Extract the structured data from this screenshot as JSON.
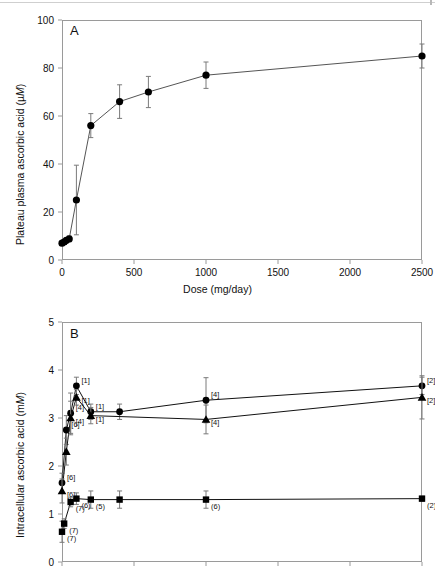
{
  "figure": {
    "panels": [
      "A",
      "B"
    ],
    "marker_color": "#000000",
    "line_color": "#555555",
    "axis_color": "#9a9a9a"
  },
  "panelA": {
    "letter": "A",
    "ytitle_plain": "Plateau plasma ascorbic acid (µM)",
    "ytitle_pre": "Plateau plasma ascorbic acid (µ",
    "ytitle_italic": "M",
    "ytitle_post": ")",
    "xtitle": "Dose (mg/day)",
    "yticks": [
      "0",
      "20",
      "40",
      "60",
      "80",
      "100"
    ],
    "xticks": [
      "0",
      "500",
      "1000",
      "1500",
      "2000",
      "2500"
    ]
  },
  "panelB": {
    "letter": "B",
    "ytitle_pre": "Intracellular ascorbic acid (m",
    "ytitle_italic": "M",
    "ytitle_post": ")",
    "yticks": [
      "0",
      "1",
      "2",
      "3",
      "4",
      "5"
    ],
    "xtitle": ""
  },
  "chart_data": [
    {
      "type": "line",
      "panel": "A",
      "title": "Plateau plasma ascorbic acid versus dose",
      "xlabel": "Dose (mg/day)",
      "ylabel": "Plateau plasma ascorbic acid (µM)",
      "xlim": [
        0,
        2500
      ],
      "ylim": [
        0,
        100
      ],
      "xticks": [
        0,
        500,
        1000,
        1500,
        2000,
        2500
      ],
      "yticks": [
        0,
        20,
        40,
        60,
        80,
        100
      ],
      "grid": false,
      "legend": "none",
      "marker": "filled-circle",
      "series": [
        {
          "name": "Plateau plasma ascorbic acid",
          "x": [
            0,
            15,
            30,
            50,
            100,
            200,
            400,
            1000,
            2500
          ],
          "values": [
            7.0,
            7.5,
            8.2,
            8.8,
            25.0,
            56.0,
            66.0,
            70.0,
            77.0
          ],
          "errors": [
            1.0,
            1.0,
            1.0,
            1.2,
            14.5,
            5.0,
            7.0,
            6.5,
            5.5
          ]
        }
      ],
      "points": [
        {
          "x": 0,
          "y": 7.0,
          "err": 1.0
        },
        {
          "x": 15,
          "y": 7.5,
          "err": 1.0
        },
        {
          "x": 30,
          "y": 8.2,
          "err": 1.0
        },
        {
          "x": 50,
          "y": 8.8,
          "err": 1.2
        },
        {
          "x": 100,
          "y": 25.0,
          "err": 14.5
        },
        {
          "x": 200,
          "y": 56.0,
          "err": 5.0
        },
        {
          "x": 400,
          "y": 66.0,
          "err": 7.0
        },
        {
          "x": 600,
          "y": 70.0,
          "err": 6.5
        },
        {
          "x": 1000,
          "y": 77.0,
          "err": 5.5
        },
        {
          "x": 2500,
          "y": 85.0,
          "err": 5.0
        }
      ]
    },
    {
      "type": "line",
      "panel": "B",
      "title": "Intracellular ascorbic acid versus dose",
      "xlabel": "",
      "ylabel": "Intracellular ascorbic acid (mM)",
      "xlim": [
        0,
        2500
      ],
      "ylim": [
        0,
        5
      ],
      "xticks": [
        0,
        500,
        1000,
        1500,
        2000,
        2500
      ],
      "yticks": [
        0,
        1,
        2,
        3,
        4,
        5
      ],
      "grid": false,
      "legend": "none",
      "series": [
        {
          "name": "Neutrophils",
          "marker": "filled-circle",
          "label_style": "brackets",
          "x": [
            0,
            30,
            60,
            100,
            200,
            400,
            1000,
            2500
          ],
          "values": [
            1.65,
            2.75,
            3.1,
            3.67,
            3.13,
            3.13,
            3.37,
            3.67
          ],
          "errors": [
            0.2,
            0.3,
            0.42,
            0.18,
            0.16,
            0.16,
            0.47,
            0.18
          ],
          "labels": [
            "[6]",
            "[6]",
            "[4]",
            "[1]",
            "[1]",
            "",
            "[4]",
            "[2]"
          ]
        },
        {
          "name": "Monocytes",
          "marker": "filled-triangle",
          "label_style": "brackets",
          "x": [
            0,
            30,
            60,
            100,
            200,
            1000,
            2500
          ],
          "values": [
            1.48,
            2.3,
            3.0,
            3.43,
            3.05,
            2.97,
            3.43
          ],
          "errors": [
            0.25,
            0.28,
            0.35,
            0.16,
            0.17,
            0.3,
            0.45
          ],
          "labels": [
            "[6]",
            "",
            "[4]",
            "[1]",
            "[1]",
            "[4]",
            "[2]"
          ]
        },
        {
          "name": "Lymphocytes",
          "marker": "filled-square",
          "label_style": "parentheses",
          "x": [
            0,
            15,
            60,
            100,
            200,
            400,
            1000,
            2500
          ],
          "values": [
            0.63,
            0.8,
            1.25,
            1.32,
            1.3,
            1.3,
            1.3,
            1.32
          ],
          "errors": [
            0.22,
            0.1,
            0.1,
            0.12,
            0.18,
            0.18,
            0.18,
            0.05
          ],
          "labels": [
            "(7)",
            "(7)",
            "(7)",
            "(6)",
            "(5)",
            "",
            "(6)",
            "(2)"
          ]
        }
      ],
      "annotations": [
        {
          "text": "[1]",
          "series": "Neutrophils"
        },
        {
          "text": "[4]",
          "series": "Neutrophils"
        },
        {
          "text": "[6]",
          "series": "Neutrophils"
        },
        {
          "text": "[2]",
          "series": "Neutrophils"
        },
        {
          "text": "[1]",
          "series": "Monocytes"
        },
        {
          "text": "[4]",
          "series": "Monocytes"
        },
        {
          "text": "[6]",
          "series": "Monocytes"
        },
        {
          "text": "(7)",
          "series": "Lymphocytes"
        },
        {
          "text": "(6)",
          "series": "Lymphocytes"
        },
        {
          "text": "(5)",
          "series": "Lymphocytes"
        },
        {
          "text": "(2)",
          "series": "Lymphocytes"
        }
      ]
    }
  ]
}
